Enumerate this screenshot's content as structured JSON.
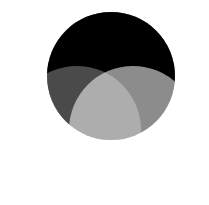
{
  "figure": {
    "name": "three-circle-venn-diagram",
    "type": "venn",
    "width": 209,
    "height": 205,
    "background_color": "#ffffff",
    "title": "",
    "labels_visible": false
  },
  "chart_data": {
    "type": "venn",
    "title": "",
    "xlabel": "",
    "ylabel": "",
    "background": "#ffffff",
    "set_count": 3,
    "radius": 64,
    "circles": [
      {
        "id": "set-a",
        "label": "",
        "position": "top",
        "cx": 111,
        "cy": 76,
        "r": 64,
        "fill": "#1c1c1c",
        "opacity": 1.0,
        "observed_solo_color": "#1a1a1a"
      },
      {
        "id": "set-b",
        "label": "",
        "position": "bottom-left",
        "cx": 77,
        "cy": 130,
        "r": 64,
        "fill": "#ffffff",
        "opacity": 0.29,
        "observed_solo_color": "#b5b5b5"
      },
      {
        "id": "set-c",
        "label": "",
        "position": "bottom-right",
        "cx": 133,
        "cy": 130,
        "r": 64,
        "fill": "#ffffff",
        "opacity": 0.55,
        "observed_solo_color": "#f2f2f2"
      }
    ],
    "regions": [
      {
        "id": "a-only",
        "sets": [
          "set-a"
        ],
        "color": "#1a1a1a"
      },
      {
        "id": "b-only",
        "sets": [
          "set-b"
        ],
        "color": "#b5b5b5"
      },
      {
        "id": "c-only",
        "sets": [
          "set-c"
        ],
        "color": "#f2f2f2"
      },
      {
        "id": "ab",
        "sets": [
          "set-a",
          "set-b"
        ],
        "color": "#545454"
      },
      {
        "id": "ac",
        "sets": [
          "set-a",
          "set-c"
        ],
        "color": "#939393"
      },
      {
        "id": "bc",
        "sets": [
          "set-b",
          "set-c"
        ],
        "color": "#eeeeee"
      },
      {
        "id": "abc",
        "sets": [
          "set-a",
          "set-b",
          "set-c"
        ],
        "color": "#b9b9b9"
      }
    ],
    "legend": {
      "visible": false,
      "entries": []
    },
    "annotations": []
  }
}
